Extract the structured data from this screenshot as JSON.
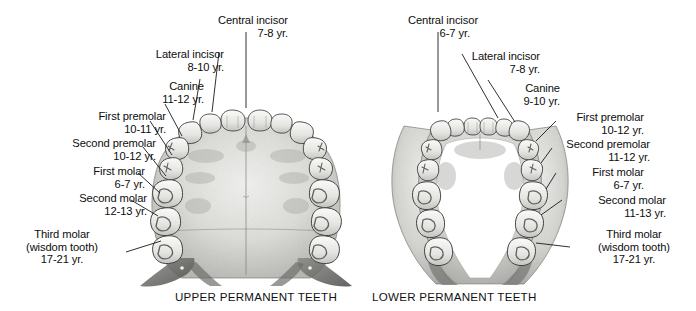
{
  "figure": {
    "title_upper": "UPPER PERMANENT TEETH",
    "title_lower": "LOWER PERMANENT TEETH",
    "ink_color": "#1a1a1a",
    "tooth_fill": "#e9e9e7",
    "bone_fill": "#d8d8d6"
  },
  "upper": {
    "caption": "UPPER PERMANENT TEETH",
    "labels": [
      {
        "name": "Central incisor",
        "age": "7-8 yr."
      },
      {
        "name": "Lateral incisor",
        "age": "8-10 yr."
      },
      {
        "name": "Canine",
        "age": "11-12 yr."
      },
      {
        "name": "First premolar",
        "age": "10-11 yr."
      },
      {
        "name": "Second premolar",
        "age": "10-12 yr."
      },
      {
        "name": "First molar",
        "age": "6-7 yr."
      },
      {
        "name": "Second molar",
        "age": "12-13 yr."
      },
      {
        "name": "Third molar",
        "sub": "(wisdom tooth)",
        "age": "17-21 yr."
      }
    ]
  },
  "lower": {
    "caption": "LOWER PERMANENT TEETH",
    "labels": [
      {
        "name": "Central incisor",
        "age": "6-7 yr."
      },
      {
        "name": "Lateral incisor",
        "age": "7-8 yr."
      },
      {
        "name": "Canine",
        "age": "9-10 yr."
      },
      {
        "name": "First premolar",
        "age": "10-12 yr."
      },
      {
        "name": "Second premolar",
        "age": "11-12 yr."
      },
      {
        "name": "First molar",
        "age": "6-7 yr."
      },
      {
        "name": "Second molar",
        "age": "11-13 yr."
      },
      {
        "name": "Third molar",
        "sub": "(wisdom tooth)",
        "age": "17-21 yr."
      }
    ]
  }
}
